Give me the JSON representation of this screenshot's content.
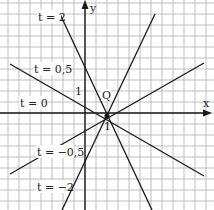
{
  "diagram": {
    "type": "line-family",
    "axes": {
      "x_label": "x",
      "y_label": "y",
      "x_unit_label": "1",
      "y_unit_label": "1"
    },
    "point": {
      "label": "Q"
    },
    "lines": [
      {
        "id": "t2",
        "label": "t = 2"
      },
      {
        "id": "t05",
        "label": "t = 0,5"
      },
      {
        "id": "t0",
        "label": "t = 0"
      },
      {
        "id": "tm05",
        "label": "t = −0,5"
      },
      {
        "id": "tm2",
        "label": "t = −2"
      }
    ],
    "colors": {
      "grid": "#b8b8b8",
      "axis": "#1a1a1a",
      "line": "#1a1a1a",
      "background": "#ffffff"
    }
  }
}
